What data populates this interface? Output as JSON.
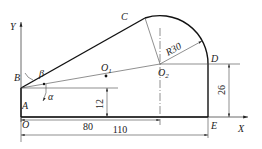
{
  "diagram": {
    "type": "geometric construction drawing",
    "axes": {
      "x_label": "X",
      "y_label": "Y"
    },
    "points": {
      "O": "O",
      "A": "A",
      "B": "B",
      "C": "C",
      "D": "D",
      "E": "E",
      "O1": "O",
      "O1_sub": "1",
      "O2": "O",
      "O2_sub": "2"
    },
    "angles": {
      "alpha": "α",
      "beta": "β"
    },
    "dimensions": {
      "radius": "R30",
      "height_AB": "12",
      "height_DE": "26",
      "length_80": "80",
      "length_110": "110"
    }
  }
}
